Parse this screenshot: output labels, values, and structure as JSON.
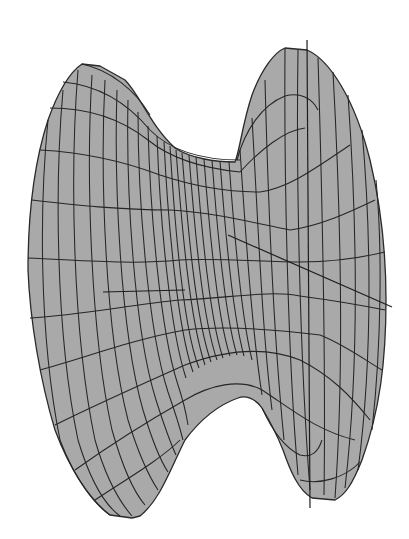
{
  "figure": {
    "type": "3d-wireframe-surface",
    "colors": {
      "background": "#ffffff",
      "surface_fill": "#a9a9a9",
      "mesh_lines": "#262626",
      "axis_lines": "#1e1e1e"
    },
    "mesh": {
      "left_lobe_meridians": 14,
      "right_lobe_meridians": 10,
      "throat_meridians": 18,
      "parallels": 12
    },
    "axes": [
      {
        "name": "vertical-axis",
        "from": [
          307,
          40
        ],
        "to": [
          310,
          508
        ]
      },
      {
        "name": "horizontal-axis",
        "from": [
          103,
          292
        ],
        "to": [
          185,
          290
        ]
      },
      {
        "name": "diagonal-axis",
        "from": [
          228,
          235
        ],
        "to": [
          392,
          307
        ]
      }
    ]
  }
}
